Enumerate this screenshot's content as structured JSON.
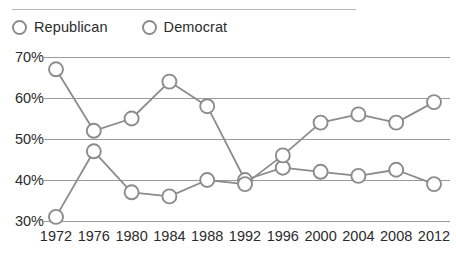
{
  "chart_data": {
    "type": "line",
    "title": "",
    "xlabel": "",
    "ylabel": "",
    "categories": [
      "1972",
      "1976",
      "1980",
      "1984",
      "1988",
      "1992",
      "1996",
      "2000",
      "2004",
      "2008",
      "2012"
    ],
    "series": [
      {
        "name": "Republican",
        "values": [
          67,
          52,
          55,
          64,
          58,
          40,
          43,
          42,
          41,
          42.5,
          39
        ]
      },
      {
        "name": "Democrat",
        "values": [
          31,
          47,
          37,
          36,
          40,
          39,
          46,
          54,
          56,
          54,
          59
        ]
      }
    ],
    "ylim": [
      30,
      70
    ],
    "ytick_values": [
      70,
      60,
      50,
      40,
      30
    ],
    "ytick_labels": [
      "70%",
      "60%",
      "50%",
      "40%",
      "30%"
    ],
    "grid": true,
    "legend_position": "top-left",
    "marker": "open-circle",
    "colors": {
      "line": "#8c8c8c",
      "marker_stroke": "#8c8c8c",
      "marker_fill": "#ffffff",
      "gridline": "#9a9a9a",
      "text": "#2b2b2b",
      "rule": "#b9b9b9"
    }
  },
  "legend": {
    "entries": [
      {
        "label": "Republican",
        "marker_name": "legend-marker-republican"
      },
      {
        "label": "Democrat",
        "marker_name": "legend-marker-democrat"
      }
    ]
  }
}
